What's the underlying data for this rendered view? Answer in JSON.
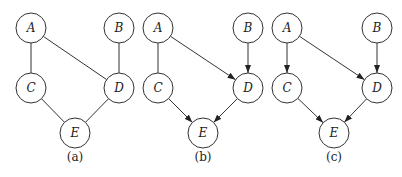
{
  "node_radius": 15,
  "panels": [
    {
      "caption": "(a)",
      "caption_pos": [
        75,
        157
      ],
      "nodes": [
        {
          "id": "A",
          "label": "A",
          "x": 31,
          "y": 28
        },
        {
          "id": "B",
          "label": "B",
          "x": 119,
          "y": 28
        },
        {
          "id": "C",
          "label": "C",
          "x": 31,
          "y": 88
        },
        {
          "id": "D",
          "label": "D",
          "x": 119,
          "y": 88
        },
        {
          "id": "E",
          "label": "E",
          "x": 75,
          "y": 133
        }
      ],
      "edges": [
        {
          "from": "A",
          "to": "C",
          "directed": false
        },
        {
          "from": "A",
          "to": "D",
          "directed": false
        },
        {
          "from": "B",
          "to": "D",
          "directed": false
        },
        {
          "from": "C",
          "to": "E",
          "directed": false
        },
        {
          "from": "D",
          "to": "E",
          "directed": false
        }
      ]
    },
    {
      "caption": "(b)",
      "caption_pos": [
        203,
        157
      ],
      "nodes": [
        {
          "id": "A",
          "label": "A",
          "x": 158,
          "y": 28
        },
        {
          "id": "B",
          "label": "B",
          "x": 248,
          "y": 28
        },
        {
          "id": "C",
          "label": "C",
          "x": 158,
          "y": 88
        },
        {
          "id": "D",
          "label": "D",
          "x": 248,
          "y": 88
        },
        {
          "id": "E",
          "label": "E",
          "x": 203,
          "y": 133
        }
      ],
      "edges": [
        {
          "from": "A",
          "to": "C",
          "directed": false
        },
        {
          "from": "A",
          "to": "D",
          "directed": true
        },
        {
          "from": "B",
          "to": "D",
          "directed": true
        },
        {
          "from": "C",
          "to": "E",
          "directed": true
        },
        {
          "from": "D",
          "to": "E",
          "directed": true
        }
      ]
    },
    {
      "caption": "(c)",
      "caption_pos": [
        334,
        157
      ],
      "nodes": [
        {
          "id": "A",
          "label": "A",
          "x": 287,
          "y": 28
        },
        {
          "id": "B",
          "label": "B",
          "x": 377,
          "y": 28
        },
        {
          "id": "C",
          "label": "C",
          "x": 287,
          "y": 88
        },
        {
          "id": "D",
          "label": "D",
          "x": 377,
          "y": 88
        },
        {
          "id": "E",
          "label": "E",
          "x": 334,
          "y": 133
        }
      ],
      "edges": [
        {
          "from": "A",
          "to": "C",
          "directed": true
        },
        {
          "from": "A",
          "to": "D",
          "directed": true
        },
        {
          "from": "B",
          "to": "D",
          "directed": true
        },
        {
          "from": "C",
          "to": "E",
          "directed": true
        },
        {
          "from": "D",
          "to": "E",
          "directed": true
        }
      ]
    }
  ]
}
